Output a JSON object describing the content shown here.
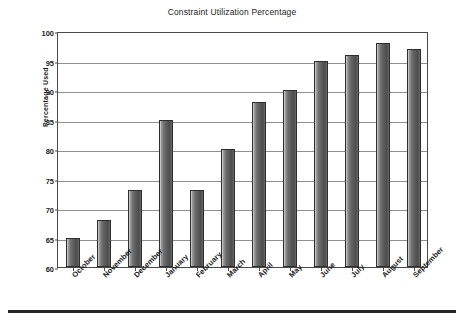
{
  "chart_data": {
    "type": "bar",
    "title": "Constraint Utilization Percentage",
    "xlabel": "",
    "ylabel": "Percentage Used",
    "categories": [
      "October",
      "November",
      "December",
      "January",
      "February",
      "March",
      "April",
      "May",
      "June",
      "July",
      "August",
      "September"
    ],
    "values": [
      65,
      68,
      73,
      85,
      73,
      80,
      88,
      90,
      95,
      96,
      98,
      97
    ],
    "ylim": [
      60,
      100
    ],
    "yticks": [
      60,
      65,
      70,
      75,
      80,
      85,
      90,
      95,
      100
    ],
    "ytick_labels": [
      "60",
      "65",
      "70",
      "75",
      "80",
      "85",
      "90",
      "95",
      "100"
    ],
    "grid": true,
    "legend": false,
    "series": [
      {
        "name": "Percentage Used",
        "values": [
          65,
          68,
          73,
          85,
          73,
          80,
          88,
          90,
          95,
          96,
          98,
          97
        ]
      }
    ],
    "colors": {
      "bar_fill_light": "#d9d9d9",
      "bar_fill_dark": "#4c4c4c",
      "bar_outline": "#2e2e2e",
      "gridline": "#8f8f8f",
      "axis": "#4a4a4a",
      "plot_background": "#ffffff",
      "text": "#1c1c1c"
    }
  }
}
